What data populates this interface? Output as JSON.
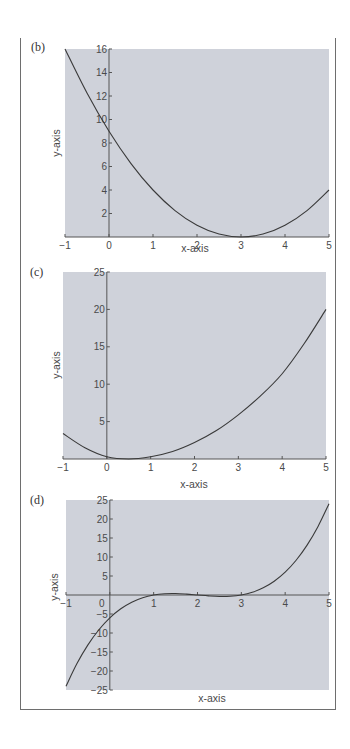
{
  "figure": {
    "panels": [
      "(b)",
      "(c)",
      "(d)"
    ],
    "xlabel": "x-axis",
    "ylabel": "y-axis",
    "colors": {
      "plot_bg": "#cfd2da",
      "curve": "#3a3a3a",
      "axis": "#555555",
      "frame": "#6e6e6e"
    }
  },
  "chart_data": [
    {
      "type": "line",
      "panel": "(b)",
      "title": "",
      "xlabel": "x-axis",
      "ylabel": "y-axis",
      "xlim": [
        -1,
        5
      ],
      "ylim": [
        0,
        16
      ],
      "xticks": [
        -1,
        0,
        1,
        2,
        3,
        4,
        5
      ],
      "yticks": [
        2,
        4,
        6,
        8,
        10,
        12,
        14,
        16
      ],
      "grid": false,
      "series": [
        {
          "name": "curve",
          "function": "(x-3)^2",
          "x": [
            -1,
            -0.5,
            0,
            0.5,
            1,
            1.5,
            2,
            2.5,
            3,
            3.5,
            4,
            4.5,
            5
          ],
          "y": [
            16,
            12.25,
            9,
            6.25,
            4,
            2.25,
            1,
            0.25,
            0,
            0.25,
            1,
            2.25,
            4
          ]
        }
      ]
    },
    {
      "type": "line",
      "panel": "(c)",
      "title": "",
      "xlabel": "x-axis",
      "ylabel": "y-axis",
      "xlim": [
        -1,
        5
      ],
      "ylim": [
        0,
        25
      ],
      "xticks": [
        -1,
        0,
        1,
        2,
        3,
        4,
        5
      ],
      "yticks": [
        5,
        10,
        15,
        20,
        25
      ],
      "grid": false,
      "series": [
        {
          "name": "curve",
          "x": [
            -1,
            -0.5,
            0,
            0.5,
            1,
            1.5,
            2,
            2.5,
            3,
            3.5,
            4,
            4.5,
            5
          ],
          "y": [
            3.4,
            1.5,
            0.3,
            0,
            0.3,
            1.0,
            2.2,
            3.8,
            5.9,
            8.4,
            11.4,
            15.4,
            20
          ]
        }
      ]
    },
    {
      "type": "line",
      "panel": "(d)",
      "title": "",
      "xlabel": "x-axis",
      "ylabel": "y-axis",
      "xlim": [
        -1,
        5
      ],
      "ylim": [
        -25,
        25
      ],
      "xticks": [
        -1,
        0,
        1,
        2,
        3,
        4,
        5
      ],
      "yticks": [
        -25,
        -20,
        -15,
        -10,
        -5,
        0,
        5,
        10,
        15,
        20,
        25
      ],
      "grid": false,
      "series": [
        {
          "name": "curve",
          "function": "(x-1)(x-2)(x-3)",
          "x": [
            -1,
            -0.75,
            -0.5,
            -0.25,
            0,
            0.25,
            0.5,
            0.75,
            1,
            1.25,
            1.5,
            1.75,
            2,
            2.25,
            2.5,
            2.75,
            3,
            3.25,
            3.5,
            3.75,
            4,
            4.25,
            4.5,
            4.75,
            5
          ],
          "y": [
            -24,
            -18.05,
            -13.13,
            -9.14,
            -6,
            -3.61,
            -1.88,
            -0.7,
            0,
            0.33,
            0.38,
            0.23,
            0,
            -0.23,
            -0.38,
            -0.33,
            0,
            0.7,
            1.88,
            3.61,
            6,
            9.14,
            13.13,
            18.05,
            24
          ]
        }
      ]
    }
  ]
}
